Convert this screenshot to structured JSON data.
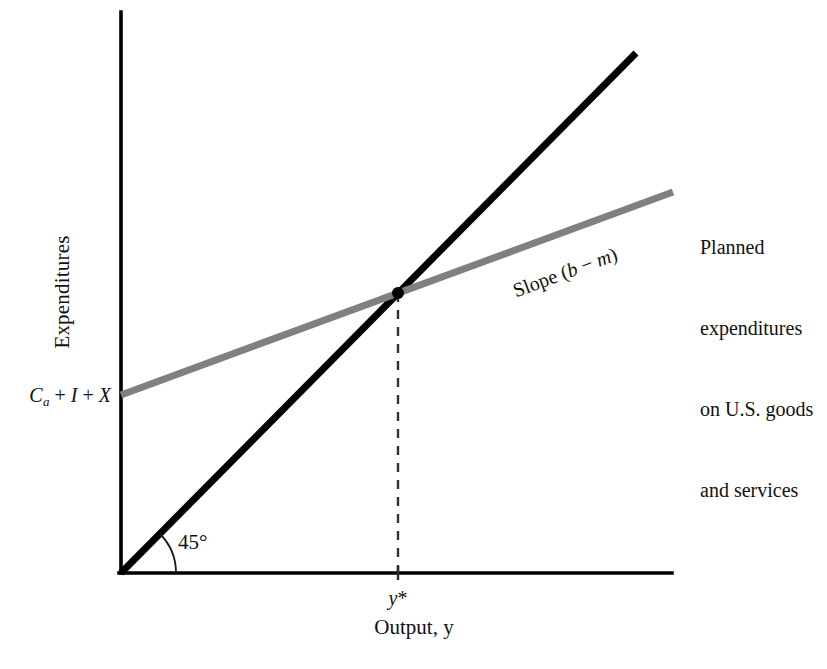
{
  "figure": {
    "type": "line-diagram",
    "background_color": "#ffffff",
    "axis_color": "#000000",
    "line_45_color": "#000000",
    "planned_line_color": "#808080",
    "dashed_line_color": "#333333",
    "point_color": "#000000"
  },
  "axes": {
    "y_title": "Expenditures",
    "x_title": "Output, y",
    "origin_label": "",
    "y_axis_top_px": 12,
    "y_axis_bottom_px": 573,
    "x_axis_left_px": 121,
    "x_axis_right_px": 672
  },
  "labels": {
    "intercept": {
      "prefix": "C",
      "subscript": "a",
      "rest_1": " + ",
      "term_2": "I",
      "rest_2": " + ",
      "term_3": "X",
      "full_text": "Ca + I + X"
    },
    "equilibrium_tick": {
      "variable": "y",
      "star": "*",
      "full_text": "y*"
    },
    "angle": "45°",
    "slope": {
      "word": "Slope (",
      "var_1": "b",
      "minus": " − ",
      "var_2": "m",
      "close": ")",
      "full_text": "Slope (b − m)"
    },
    "planned_note_lines": [
      "Planned",
      "expenditures",
      "on U.S. goods",
      "and services"
    ]
  },
  "chart_data": {
    "type": "line",
    "title": "",
    "subtitle": "",
    "xlabel": "Output, y",
    "ylabel": "Expenditures",
    "grid": false,
    "legend_position": "right-inline-annotation",
    "xlim": [
      0,
      1
    ],
    "ylim": [
      0,
      1
    ],
    "annotations": [
      {
        "name": "angle-45",
        "text": "45°",
        "x_px": 178,
        "y_px": 542
      },
      {
        "name": "slope-label",
        "text": "Slope (b − m)",
        "x_px": 565,
        "y_px": 272,
        "rotation_deg": -20.2
      },
      {
        "name": "intercept-label",
        "text": "Ca + I + X",
        "x_px": 115,
        "y_px": 396
      },
      {
        "name": "equilibrium-label",
        "text": "y*",
        "x_px": 398,
        "y_px": 598
      },
      {
        "name": "planned-expenditure-note",
        "text": "Planned expenditures on U.S. goods and services",
        "x_px": 700,
        "y_px": 180
      }
    ],
    "series": [
      {
        "name": "45-degree line",
        "label": "45° line (y = E)",
        "color": "#000000",
        "width_px": 7,
        "style": "solid",
        "points_px": [
          [
            121,
            573
          ],
          [
            636,
            53
          ]
        ],
        "slope_note": "45°",
        "intercept_value": 0
      },
      {
        "name": "Planned expenditures on U.S. goods and services",
        "label": "Planned expenditures on U.S. goods and services",
        "color": "#808080",
        "width_px": 7,
        "style": "solid",
        "points_px": [
          [
            121,
            395
          ],
          [
            673,
            192
          ]
        ],
        "slope_note": "Slope (b − m)",
        "intercept_label": "Ca + I + X"
      },
      {
        "name": "equilibrium-dropline",
        "label": "y*",
        "color": "#333333",
        "width_px": 2.4,
        "style": "dashed",
        "points_px": [
          [
            398,
            293
          ],
          [
            398,
            573
          ]
        ]
      }
    ],
    "points": [
      {
        "name": "equilibrium-point",
        "label": "equilibrium",
        "x_px": 398,
        "y_px": 293,
        "radius_px": 6,
        "color": "#000000"
      }
    ]
  }
}
